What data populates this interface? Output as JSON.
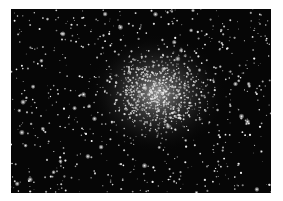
{
  "image": {
    "subject": "globular star cluster",
    "background_color": "#060606",
    "frame_color": "#ffffff",
    "core_center": [
      146,
      84
    ],
    "star_count": 1400,
    "bright_star_count": 60,
    "seed": 7
  }
}
